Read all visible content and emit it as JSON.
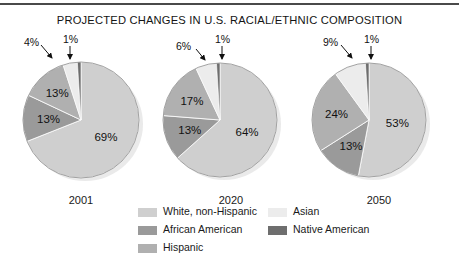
{
  "title": "PROJECTED CHANGES IN U.S. RACIAL/ETHNIC COMPOSITION",
  "legend": {
    "entries": [
      {
        "label": "White, non-Hispanic",
        "color": "#cfcfcf"
      },
      {
        "label": "African American",
        "color": "#9a9a9a"
      },
      {
        "label": "Hispanic",
        "color": "#b0b0b0"
      },
      {
        "label": "Asian",
        "color": "#ececec"
      },
      {
        "label": "Native American",
        "color": "#6e6e6e"
      }
    ]
  },
  "chart_data": {
    "type": "pie",
    "title": "PROJECTED CHANGES IN U.S. RACIAL/ETHNIC COMPOSITION",
    "ylabel": "",
    "xlabel": "",
    "unit": "percent",
    "categories": [
      "White, non-Hispanic",
      "African American",
      "Hispanic",
      "Asian",
      "Native American"
    ],
    "colors": [
      "#cfcfcf",
      "#9a9a9a",
      "#b0b0b0",
      "#ececec",
      "#6e6e6e"
    ],
    "legend_position": "bottom",
    "charts": [
      {
        "year": "2001",
        "values": [
          69,
          13,
          13,
          4,
          1
        ],
        "labels": [
          "69%",
          "13%",
          "13%",
          "4%",
          "1%"
        ],
        "callouts": [
          {
            "label": "4%",
            "slice": "Asian",
            "x": 30,
            "y": 36
          },
          {
            "label": "1%",
            "slice": "Native American",
            "x": 66,
            "y": 32
          }
        ]
      },
      {
        "year": "2020",
        "values": [
          64,
          13,
          17,
          6,
          1
        ],
        "labels": [
          "64%",
          "13%",
          "17%",
          "6%",
          "1%"
        ],
        "callouts": [
          {
            "label": "6%",
            "slice": "Asian",
            "x": 182,
            "y": 40
          },
          {
            "label": "1%",
            "slice": "Native American",
            "x": 216,
            "y": 34
          }
        ]
      },
      {
        "year": "2050",
        "values": [
          53,
          13,
          24,
          9,
          1
        ],
        "labels": [
          "53%",
          "13%",
          "24%",
          "9%",
          "1%"
        ],
        "callouts": [
          {
            "label": "9%",
            "slice": "Asian",
            "x": 329,
            "y": 36
          },
          {
            "label": "1%",
            "slice": "Native American",
            "x": 366,
            "y": 32
          }
        ]
      }
    ]
  },
  "pies": [
    {
      "year": "2001",
      "slice_labels": {
        "white": "69%",
        "african_american": "13%",
        "hispanic": "13%"
      }
    },
    {
      "year": "2020",
      "slice_labels": {
        "white": "64%",
        "african_american": "13%",
        "hispanic": "17%"
      }
    },
    {
      "year": "2050",
      "slice_labels": {
        "white": "53%",
        "african_american": "13%",
        "hispanic": "24%"
      }
    }
  ],
  "callout_labels": {
    "p0_asian": "4%",
    "p0_native": "1%",
    "p1_asian": "6%",
    "p1_native": "1%",
    "p2_asian": "9%",
    "p2_native": "1%"
  }
}
